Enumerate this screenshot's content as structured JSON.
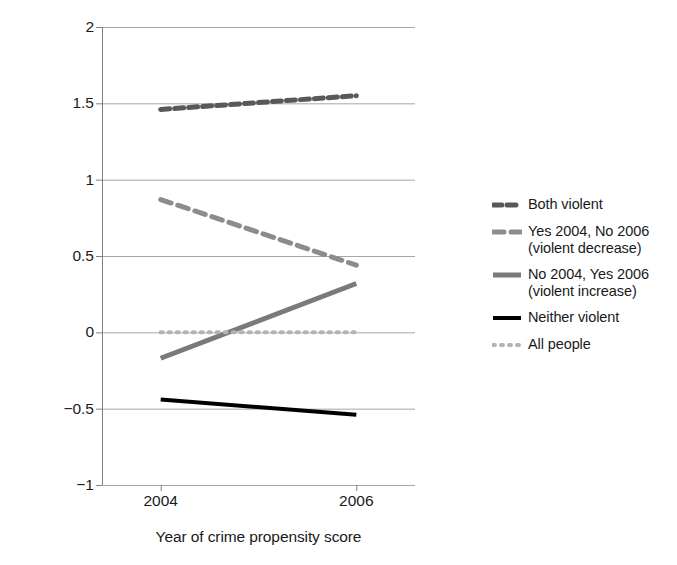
{
  "chart_data": {
    "type": "line",
    "title": "",
    "subtitle": "",
    "xlabel": "Year of crime propensity score",
    "ylabel": "Mean standardized crime propensity score (by year)",
    "x": [
      2004,
      2006
    ],
    "xticklabels": [
      "2004",
      "2006"
    ],
    "xlim": [
      2003.4,
      2006.6
    ],
    "ylim": [
      -1,
      2
    ],
    "yticks": [
      2,
      1.5,
      1,
      0.5,
      0,
      -0.5,
      -1
    ],
    "yticklabels": [
      "2",
      "1.5",
      "1",
      "0.5",
      "0",
      "−0.5",
      "−1"
    ],
    "grid": "horizontal",
    "legend_position": "right",
    "series": [
      {
        "name": "Both violent",
        "values": [
          1.46,
          1.55
        ],
        "color": "#595959",
        "style": "dashed",
        "linewidth": 5,
        "dash": "9,5"
      },
      {
        "name": "Yes 2004, No 2006\n(violent decrease)",
        "legend_label": "Yes 2004, No 2006\n(violent decrease)",
        "values": [
          0.87,
          0.44
        ],
        "color": "#8c8c8c",
        "style": "dashed",
        "linewidth": 5,
        "dash": "11,7"
      },
      {
        "name": "No 2004, Yes 2006\n(violent increase)",
        "legend_label": "No 2004, Yes 2006\n(violent increase)",
        "values": [
          -0.17,
          0.32
        ],
        "color": "#7a7a7a",
        "style": "solid",
        "linewidth": 5,
        "dash": "none"
      },
      {
        "name": "Neither violent",
        "legend_label": "Neither violent",
        "values": [
          -0.44,
          -0.54
        ],
        "color": "#000000",
        "style": "solid",
        "linewidth": 4,
        "dash": "none"
      },
      {
        "name": "All people",
        "legend_label": "All people",
        "values": [
          0.0,
          0.0
        ],
        "color": "#b3b3b3",
        "style": "dotted",
        "linewidth": 4,
        "dash": "2,6"
      }
    ]
  },
  "axes": {
    "y_title": "Mean standardized crime propensity score (by year)",
    "x_title": "Year of crime propensity score",
    "y_ticks": [
      {
        "value": 2,
        "label": "2"
      },
      {
        "value": 1.5,
        "label": "1.5"
      },
      {
        "value": 1,
        "label": "1"
      },
      {
        "value": 0.5,
        "label": "0.5"
      },
      {
        "value": 0,
        "label": "0"
      },
      {
        "value": -0.5,
        "label": "−0.5"
      },
      {
        "value": -1,
        "label": "−1"
      }
    ],
    "x_ticks": [
      {
        "value": 2004,
        "label": "2004"
      },
      {
        "value": 2006,
        "label": "2006"
      }
    ],
    "gridline_color": "#a6a6a6",
    "axis_color": "#808080"
  },
  "legend": {
    "entries": [
      {
        "label": "Both violent",
        "color": "#595959",
        "dash": "9,5",
        "width": 5
      },
      {
        "label": "Yes 2004, No 2006\n(violent decrease)",
        "color": "#8c8c8c",
        "dash": "11,7",
        "width": 5
      },
      {
        "label": "No 2004, Yes 2006\n(violent increase)",
        "color": "#7a7a7a",
        "dash": "none",
        "width": 5
      },
      {
        "label": "Neither violent",
        "color": "#000000",
        "dash": "none",
        "width": 4
      },
      {
        "label": "All people",
        "color": "#b3b3b3",
        "dash": "2,6",
        "width": 4
      }
    ]
  }
}
